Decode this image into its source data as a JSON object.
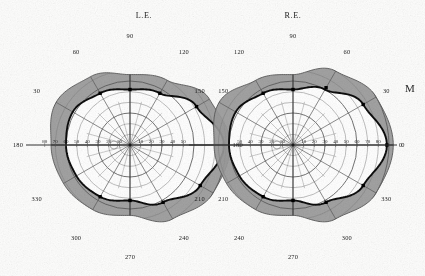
{
  "figure": {
    "kind": "binocular-visual-field-perimetry-chart",
    "eyes": [
      {
        "id": "left",
        "label": "L.E.",
        "label_x": 144,
        "label_y": 18,
        "cx": 130,
        "cy": 145,
        "mirrored": true
      },
      {
        "id": "right",
        "label": "R.E.",
        "label_x": 293,
        "label_y": 18,
        "cx": 293,
        "cy": 145,
        "mirrored": false
      }
    ],
    "margin_mark": {
      "text": "M",
      "x": 410,
      "y": 92
    }
  },
  "colors": {
    "paper": "#fdfdfc",
    "ink": "#1c1c1c",
    "grid_line": "#5a5a5a",
    "grid_line_fine": "#7e7e7e",
    "meridian": "#333333",
    "isopter": "#0d0d0d",
    "band_fill": "#9a9a9a",
    "band_fill_dark": "#8b8b8b",
    "inner_fill": "#ffffff",
    "point_marker": "#000000"
  },
  "axes": {
    "angle_unit": "degrees",
    "radius_unit": "degrees of eccentricity",
    "radial_ticks": [
      10,
      20,
      30,
      40,
      50,
      60,
      70,
      80,
      90
    ],
    "radial_grid_rings": [
      10,
      20,
      30,
      40,
      50,
      60,
      70,
      80,
      90
    ],
    "meridian_spokes_deg": [
      0,
      30,
      60,
      90,
      120,
      150,
      180,
      210,
      240,
      270,
      300,
      330
    ],
    "angle_tick_labels": [
      "0",
      "30",
      "60",
      "90",
      "120",
      "150",
      "180",
      "210",
      "240",
      "270",
      "300",
      "330"
    ]
  },
  "horizontal_scale": {
    "left_eye_labels": [
      "80",
      "70",
      "60",
      "50",
      "40",
      "30",
      "20",
      "10",
      "10",
      "20",
      "30",
      "40",
      "50"
    ],
    "right_eye_labels": [
      "50",
      "40",
      "30",
      "20",
      "10",
      "10",
      "20",
      "30",
      "40",
      "50",
      "60",
      "70",
      "80"
    ],
    "outer_left_label": "180",
    "outer_right_label": "0"
  },
  "chart_data": {
    "type": "line",
    "subtitle": "Polar perimetry: eccentricity in degrees versus meridian angle",
    "xlabel": "Meridian (degrees)",
    "ylabel": "Eccentricity (degrees)",
    "ylim": [
      0,
      90
    ],
    "grid": true,
    "legend": "none",
    "coordinate_system": "polar",
    "categories": [
      0,
      30,
      60,
      90,
      120,
      150,
      180,
      210,
      240,
      270,
      300,
      330
    ],
    "series": [
      {
        "name": "L.E. isopter",
        "eye": "left",
        "values": [
          60,
          62,
          56,
          52,
          56,
          72,
          88,
          76,
          62,
          52,
          56,
          58
        ]
      },
      {
        "name": "R.E. isopter",
        "eye": "right",
        "values": [
          88,
          76,
          60,
          52,
          56,
          62,
          60,
          58,
          56,
          52,
          62,
          76
        ]
      },
      {
        "name": "L.E. outer shaded limit",
        "eye": "left",
        "values": [
          74,
          80,
          74,
          66,
          70,
          86,
          94,
          90,
          80,
          66,
          70,
          72
        ]
      },
      {
        "name": "R.E. outer shaded limit",
        "eye": "right",
        "values": [
          94,
          90,
          80,
          66,
          70,
          80,
          74,
          72,
          70,
          66,
          80,
          90
        ]
      }
    ],
    "plotted_points": {
      "description": "Filled square test-point markers placed on each isopter",
      "left_eye_deg": [
        [
          90,
          52
        ],
        [
          60,
          56
        ],
        [
          120,
          56
        ],
        [
          150,
          72
        ],
        [
          180,
          88
        ],
        [
          210,
          76
        ],
        [
          240,
          62
        ],
        [
          270,
          52
        ],
        [
          300,
          56
        ]
      ],
      "right_eye_deg": [
        [
          90,
          52
        ],
        [
          120,
          56
        ],
        [
          60,
          62
        ],
        [
          30,
          76
        ],
        [
          0,
          88
        ],
        [
          330,
          76
        ],
        [
          300,
          62
        ],
        [
          270,
          52
        ],
        [
          240,
          56
        ]
      ]
    },
    "blind_spots": {
      "left_eye": {
        "meridian_deg": 0,
        "eccentricity_deg": 15,
        "radius_deg": 6
      },
      "right_eye": {
        "meridian_deg": 180,
        "eccentricity_deg": 15,
        "radius_deg": 6
      }
    }
  }
}
